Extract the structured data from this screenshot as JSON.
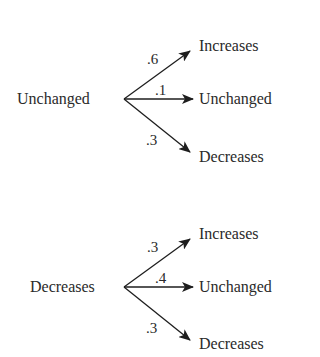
{
  "diagram": {
    "type": "probability-tree",
    "trees": [
      {
        "root": "Unchanged",
        "branches": [
          {
            "label": "Increases",
            "probability": ".6"
          },
          {
            "label": "Unchanged",
            "probability": ".1"
          },
          {
            "label": "Decreases",
            "probability": ".3"
          }
        ]
      },
      {
        "root": "Decreases",
        "branches": [
          {
            "label": "Increases",
            "probability": ".3"
          },
          {
            "label": "Unchanged",
            "probability": ".4"
          },
          {
            "label": "Decreases",
            "probability": ".3"
          }
        ]
      }
    ],
    "colors": {
      "line": "#1e1e1e",
      "text": "#2a2a2a",
      "background": "#ffffff"
    }
  }
}
